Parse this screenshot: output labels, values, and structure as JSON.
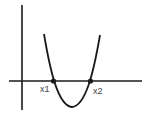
{
  "diagram": {
    "type": "parabola-roots",
    "labels": {
      "root1": "x1",
      "root2": "x2"
    },
    "colors": {
      "stroke": "#1a1a1a",
      "label": "#444444",
      "background": "#ffffff"
    }
  }
}
